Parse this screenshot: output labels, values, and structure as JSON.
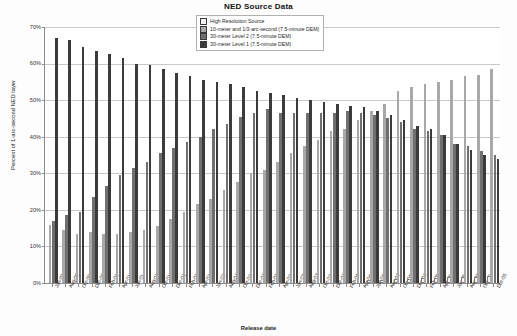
{
  "chart_data": {
    "type": "bar",
    "title": "NED Source Data",
    "xlabel": "Release date",
    "ylabel": "Percent of 1-arc-second NED layer",
    "ylim": [
      0,
      70
    ],
    "ytick_labels": [
      "0%",
      "10%",
      "20%",
      "30%",
      "40%",
      "50%",
      "60%",
      "70%"
    ],
    "ytick_values": [
      0,
      10,
      20,
      30,
      40,
      50,
      60,
      70
    ],
    "grid": true,
    "legend_position": "top-center",
    "categories": [
      "Jun-00",
      "Aug-00",
      "Oct-00",
      "Dec-00",
      "Feb-01",
      "Apr-01",
      "Jun-01",
      "Aug-01",
      "Oct-01",
      "Dec-01",
      "Feb-02",
      "Apr-02",
      "Jun-02",
      "Aug-02",
      "Oct-02",
      "Dec-02",
      "Feb-03",
      "Apr-03",
      "Jun-03",
      "Aug-03",
      "Oct-03",
      "Dec-03",
      "Feb-04",
      "Apr-04",
      "Jun-04",
      "Aug-04",
      "Oct-04",
      "Dec-04",
      "Feb-05",
      "Apr-05",
      "Jun-05",
      "Aug-05",
      "Oct-05",
      "Dec-05"
    ],
    "series": [
      {
        "name": "High Resolution Source",
        "color": "#f2f2f2",
        "values": [
          0,
          0,
          0,
          0,
          0,
          0,
          0,
          0,
          0,
          0,
          0,
          0,
          0,
          0,
          0,
          0,
          0,
          0,
          0,
          0,
          0,
          0,
          0,
          0,
          0.3,
          0.4,
          0.5,
          0.6,
          0.8,
          0.9,
          1.0,
          1.1,
          1.2,
          1.3
        ]
      },
      {
        "name": "10-meter and 1/3-arc-second (7.5-minute DEM)",
        "color": "#a8a8a8",
        "values": [
          16.0,
          14.5,
          13.5,
          14.0,
          13.5,
          13.5,
          14.0,
          14.5,
          15.5,
          17.5,
          19.5,
          21.5,
          23.0,
          25.5,
          27.5,
          30.0,
          31.0,
          33.0,
          35.5,
          37.5,
          39.0,
          41.5,
          42.0,
          44.5,
          47.0,
          49.0,
          52.5,
          53.5,
          54.5,
          55.0,
          55.5,
          56.5,
          57.0,
          58.5
        ]
      },
      {
        "name": "30-meter Level 2 (7.5-minute DEM)",
        "color": "#6f6f6f",
        "values": [
          17.0,
          18.5,
          19.5,
          23.5,
          26.5,
          29.5,
          31.5,
          33.0,
          35.5,
          37.0,
          38.5,
          40.0,
          42.0,
          43.5,
          45.5,
          46.5,
          47.5,
          46.5,
          46.5,
          46.5,
          46.5,
          46.5,
          47.0,
          46.5,
          46.0,
          45.0,
          44.0,
          42.0,
          41.5,
          40.5,
          38.0,
          37.5,
          36.0,
          35.0
        ]
      },
      {
        "name": "30-meter Level 1 (7.5-minute DEM)",
        "color": "#3b3b3b",
        "values": [
          67.0,
          66.5,
          64.5,
          63.5,
          62.5,
          61.5,
          60.0,
          59.5,
          58.5,
          57.5,
          56.5,
          55.5,
          55.0,
          54.5,
          53.5,
          52.5,
          52.0,
          51.5,
          50.5,
          50.0,
          49.5,
          49.0,
          48.5,
          48.0,
          47.0,
          46.0,
          44.5,
          43.0,
          42.0,
          40.5,
          38.0,
          36.5,
          35.0,
          34.0
        ]
      }
    ]
  }
}
